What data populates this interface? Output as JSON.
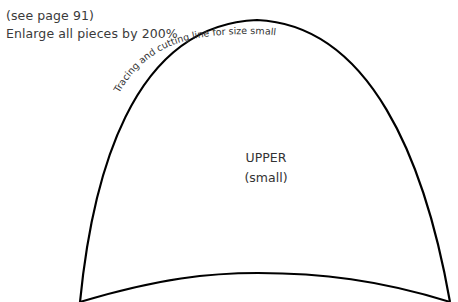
{
  "notes": {
    "page_reference": "(see page 91)",
    "enlarge_instruction": "Enlarge all pieces by 200%"
  },
  "pattern": {
    "curve_label": "Tracing and cutting line for size small",
    "piece_name": "UPPER",
    "piece_size": "(small)",
    "line_color": "#000000"
  }
}
